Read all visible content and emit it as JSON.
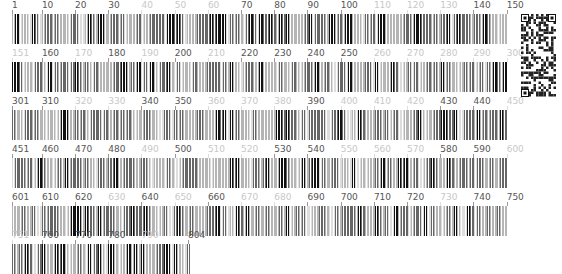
{
  "rows": [
    {
      "start": 1,
      "end": 150,
      "labels": [
        {
          "text": "1",
          "pos": 0,
          "light": false
        },
        {
          "text": "10",
          "pos": 9,
          "light": false
        },
        {
          "text": "20",
          "pos": 19,
          "light": false
        },
        {
          "text": "30",
          "pos": 29,
          "light": false
        },
        {
          "text": "40",
          "pos": 39,
          "light": true
        },
        {
          "text": "50",
          "pos": 49,
          "light": true
        },
        {
          "text": "60",
          "pos": 59,
          "light": true
        },
        {
          "text": "70",
          "pos": 69,
          "light": false
        },
        {
          "text": "80",
          "pos": 79,
          "light": false
        },
        {
          "text": "90",
          "pos": 89,
          "light": false
        },
        {
          "text": "100",
          "pos": 99,
          "light": false
        },
        {
          "text": "110",
          "pos": 109,
          "light": true
        },
        {
          "text": "120",
          "pos": 119,
          "light": true
        },
        {
          "text": "130",
          "pos": 129,
          "light": true
        },
        {
          "text": "140",
          "pos": 139,
          "light": false
        },
        {
          "text": "150",
          "pos": 149,
          "light": false
        }
      ]
    },
    {
      "start": 151,
      "end": 300,
      "labels": [
        {
          "text": "151",
          "pos": 0,
          "light": true
        },
        {
          "text": "160",
          "pos": 9,
          "light": false
        },
        {
          "text": "170",
          "pos": 19,
          "light": true
        },
        {
          "text": "180",
          "pos": 29,
          "light": false
        },
        {
          "text": "190",
          "pos": 39,
          "light": true
        },
        {
          "text": "200",
          "pos": 49,
          "light": false
        },
        {
          "text": "210",
          "pos": 59,
          "light": true
        },
        {
          "text": "220",
          "pos": 69,
          "light": false
        },
        {
          "text": "230",
          "pos": 79,
          "light": false
        },
        {
          "text": "240",
          "pos": 89,
          "light": false
        },
        {
          "text": "250",
          "pos": 99,
          "light": false
        },
        {
          "text": "260",
          "pos": 109,
          "light": true
        },
        {
          "text": "270",
          "pos": 119,
          "light": true
        },
        {
          "text": "280",
          "pos": 129,
          "light": true
        },
        {
          "text": "290",
          "pos": 139,
          "light": true
        },
        {
          "text": "300",
          "pos": 149,
          "light": true
        }
      ]
    },
    {
      "start": 301,
      "end": 450,
      "labels": [
        {
          "text": "301",
          "pos": 0,
          "light": false
        },
        {
          "text": "310",
          "pos": 9,
          "light": false
        },
        {
          "text": "320",
          "pos": 19,
          "light": true
        },
        {
          "text": "330",
          "pos": 29,
          "light": true
        },
        {
          "text": "340",
          "pos": 39,
          "light": false
        },
        {
          "text": "350",
          "pos": 49,
          "light": false
        },
        {
          "text": "360",
          "pos": 59,
          "light": true
        },
        {
          "text": "370",
          "pos": 69,
          "light": true
        },
        {
          "text": "380",
          "pos": 79,
          "light": true
        },
        {
          "text": "390",
          "pos": 89,
          "light": false
        },
        {
          "text": "400",
          "pos": 99,
          "light": true
        },
        {
          "text": "410",
          "pos": 109,
          "light": true
        },
        {
          "text": "420",
          "pos": 119,
          "light": true
        },
        {
          "text": "430",
          "pos": 129,
          "light": false
        },
        {
          "text": "440",
          "pos": 139,
          "light": false
        },
        {
          "text": "450",
          "pos": 149,
          "light": true
        }
      ]
    },
    {
      "start": 451,
      "end": 600,
      "labels": [
        {
          "text": "451",
          "pos": 0,
          "light": false
        },
        {
          "text": "460",
          "pos": 9,
          "light": false
        },
        {
          "text": "470",
          "pos": 19,
          "light": false
        },
        {
          "text": "480",
          "pos": 29,
          "light": false
        },
        {
          "text": "490",
          "pos": 39,
          "light": true
        },
        {
          "text": "500",
          "pos": 49,
          "light": false
        },
        {
          "text": "510",
          "pos": 59,
          "light": true
        },
        {
          "text": "520",
          "pos": 69,
          "light": true
        },
        {
          "text": "530",
          "pos": 79,
          "light": false
        },
        {
          "text": "540",
          "pos": 89,
          "light": false
        },
        {
          "text": "550",
          "pos": 99,
          "light": true
        },
        {
          "text": "560",
          "pos": 109,
          "light": true
        },
        {
          "text": "570",
          "pos": 119,
          "light": true
        },
        {
          "text": "580",
          "pos": 129,
          "light": false
        },
        {
          "text": "590",
          "pos": 139,
          "light": false
        },
        {
          "text": "600",
          "pos": 149,
          "light": true
        }
      ]
    },
    {
      "start": 601,
      "end": 750,
      "labels": [
        {
          "text": "601",
          "pos": 0,
          "light": false
        },
        {
          "text": "610",
          "pos": 9,
          "light": false
        },
        {
          "text": "620",
          "pos": 19,
          "light": false
        },
        {
          "text": "630",
          "pos": 29,
          "light": true
        },
        {
          "text": "640",
          "pos": 39,
          "light": false
        },
        {
          "text": "650",
          "pos": 49,
          "light": true
        },
        {
          "text": "660",
          "pos": 59,
          "light": false
        },
        {
          "text": "670",
          "pos": 69,
          "light": true
        },
        {
          "text": "680",
          "pos": 79,
          "light": true
        },
        {
          "text": "690",
          "pos": 89,
          "light": false
        },
        {
          "text": "700",
          "pos": 99,
          "light": false
        },
        {
          "text": "710",
          "pos": 109,
          "light": false
        },
        {
          "text": "720",
          "pos": 119,
          "light": false
        },
        {
          "text": "730",
          "pos": 129,
          "light": true
        },
        {
          "text": "740",
          "pos": 139,
          "light": false
        },
        {
          "text": "750",
          "pos": 149,
          "light": false
        }
      ]
    },
    {
      "start": 751,
      "end": 804,
      "labels": [
        {
          "text": "751",
          "pos": 0,
          "light": true
        },
        {
          "text": "760",
          "pos": 9,
          "light": false
        },
        {
          "text": "770",
          "pos": 19,
          "light": false
        },
        {
          "text": "780",
          "pos": 29,
          "light": false
        },
        {
          "text": "790",
          "pos": 39,
          "light": true
        },
        {
          "text": "804",
          "pos": 53,
          "light": false
        }
      ]
    }
  ],
  "sequence_length": 804,
  "qr_code": {
    "label": "qr-code"
  },
  "colors": {
    "dark": "#111111",
    "mid": "#666666",
    "light": "#b5b5b5",
    "faint": "#dddddd"
  }
}
